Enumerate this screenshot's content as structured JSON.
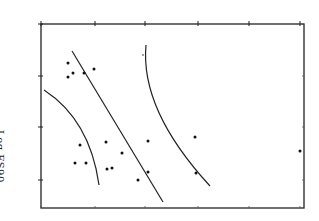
{
  "chart_data": {
    "type": "scatter",
    "title": "",
    "orientation": "rotated 90° clockwise (scanned figure)",
    "ylabel": "Log FS90",
    "xlabel": "",
    "frame": {
      "left": 41,
      "top": 24,
      "right": 304,
      "bottom": 208
    },
    "top_ticks_px": [
      41,
      95,
      145,
      198,
      249,
      300
    ],
    "left_ticks_px": [
      24,
      76,
      127,
      180
    ],
    "points_px": [
      {
        "x": 68,
        "y": 63
      },
      {
        "x": 68,
        "y": 77
      },
      {
        "x": 73,
        "y": 73
      },
      {
        "x": 84,
        "y": 73
      },
      {
        "x": 94,
        "y": 69
      },
      {
        "x": 80,
        "y": 145
      },
      {
        "x": 75,
        "y": 163
      },
      {
        "x": 86,
        "y": 163
      },
      {
        "x": 106,
        "y": 142
      },
      {
        "x": 122,
        "y": 153
      },
      {
        "x": 107,
        "y": 169
      },
      {
        "x": 112,
        "y": 168
      },
      {
        "x": 148,
        "y": 141
      },
      {
        "x": 148,
        "y": 172
      },
      {
        "x": 138,
        "y": 180
      },
      {
        "x": 195,
        "y": 137
      },
      {
        "x": 196,
        "y": 173
      },
      {
        "x": 300,
        "y": 151
      }
    ],
    "faint_points_px": [
      {
        "x": 143,
        "y": 55
      }
    ],
    "lines": [
      {
        "name": "regression-line",
        "type": "straight",
        "from": {
          "x": 72,
          "y": 51
        },
        "to": {
          "x": 163,
          "y": 202
        }
      },
      {
        "name": "lower-confidence-curve",
        "type": "curve",
        "path": "M44,90 Q90,120 99,185"
      },
      {
        "name": "upper-confidence-curve",
        "type": "curve",
        "path": "M146,45 Q140,110 210,186"
      }
    ],
    "grid": false,
    "legend": null
  }
}
